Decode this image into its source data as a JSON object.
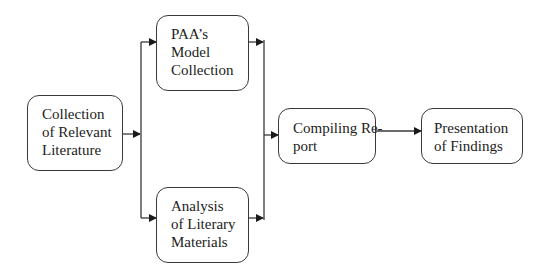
{
  "diagram": {
    "type": "flowchart",
    "direction": "left-to-right",
    "nodes": [
      {
        "id": "collection",
        "lines": [
          "Collection",
          "of Relevant",
          "Literature"
        ]
      },
      {
        "id": "paa_model",
        "lines": [
          "PAA’s",
          "Model",
          "Collection"
        ]
      },
      {
        "id": "analysis",
        "lines": [
          "Analysis",
          "of Literary",
          "Materials"
        ]
      },
      {
        "id": "compiling",
        "lines": [
          "Compiling Re-",
          "port"
        ]
      },
      {
        "id": "presentation",
        "lines": [
          "Presentation",
          "of Findings"
        ]
      }
    ],
    "edges": [
      {
        "from": "collection",
        "to": "paa_model"
      },
      {
        "from": "collection",
        "to": "analysis"
      },
      {
        "from": "paa_model",
        "to": "compiling"
      },
      {
        "from": "analysis",
        "to": "compiling"
      },
      {
        "from": "compiling",
        "to": "presentation"
      }
    ],
    "colors": {
      "stroke": "#3a3a3a",
      "text": "#222222",
      "background": "#ffffff"
    }
  }
}
